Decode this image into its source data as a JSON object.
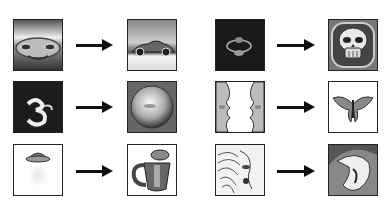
{
  "diagram": {
    "pairs": [
      {
        "input": "car-front-chrome",
        "output": "car-side-render",
        "row": 1,
        "col": 1
      },
      {
        "input": "dark-eye-shape",
        "output": "skull-render",
        "row": 1,
        "col": 2
      },
      {
        "input": "dark-digit-3",
        "output": "sphere-render",
        "row": 2,
        "col": 1
      },
      {
        "input": "symmetric-face-profiles",
        "output": "butterfly-render",
        "row": 2,
        "col": 2
      },
      {
        "input": "hat-silhouette",
        "output": "teapot-render",
        "row": 3,
        "col": 1
      },
      {
        "input": "wood-grain-texture",
        "output": "abstract-swirl-render",
        "row": 3,
        "col": 2
      }
    ],
    "arrow_color": "#111111",
    "frame_color": "#222222"
  }
}
